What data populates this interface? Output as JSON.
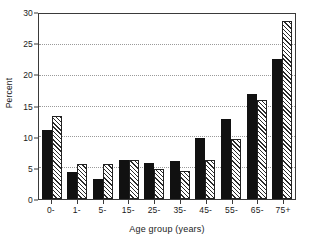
{
  "chart_data": {
    "type": "bar",
    "title": "",
    "xlabel": "Age group (years)",
    "ylabel": "Percent",
    "categories": [
      "0-",
      "1-",
      "5-",
      "15-",
      "25-",
      "35-",
      "45-",
      "55-",
      "65-",
      "75+"
    ],
    "series": [
      {
        "name": "solid",
        "style": "solid-black",
        "values": [
          11.2,
          4.3,
          3.2,
          6.4,
          5.8,
          6.1,
          9.9,
          12.9,
          17.0,
          22.7
        ]
      },
      {
        "name": "hatched",
        "style": "diagonal-hatch",
        "values": [
          13.5,
          5.6,
          5.6,
          6.3,
          4.8,
          4.5,
          6.4,
          9.7,
          16.0,
          28.8
        ]
      }
    ],
    "ylim": [
      0,
      30
    ],
    "yticks": [
      0,
      5,
      10,
      15,
      20,
      25,
      30
    ],
    "ytick_labels": [
      "0",
      "5",
      "10",
      "15",
      "20",
      "25",
      "30"
    ],
    "grid": "horizontal-dotted",
    "legend": "none"
  }
}
